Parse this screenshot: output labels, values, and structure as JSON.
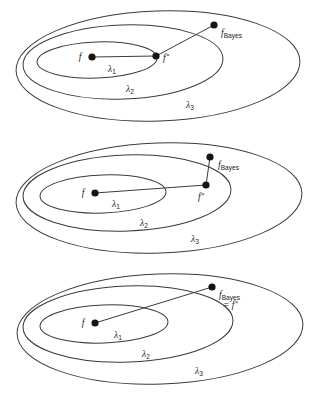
{
  "figure": {
    "background_color": "#ffffff",
    "line_color": "#3b3b3b",
    "point_color": "#141414"
  },
  "panels": [
    {
      "id": "panel-1",
      "caption": "f* on inner boundary, f_Bayes outside all classes",
      "labels": {
        "f": "f",
        "f_star": "f",
        "f_star_sup": "*",
        "f_bayes_main": "f",
        "f_bayes_sub": "Bayes",
        "f_bayes_eq": "",
        "lambda1": "λ",
        "lambda1_sub": "1",
        "lambda2": "λ",
        "lambda2_sub": "2",
        "lambda3": "λ",
        "lambda3_sub": "3"
      },
      "points": {
        "f": {
          "x": 92,
          "y": 57
        },
        "f_star": {
          "x": 156,
          "y": 56
        },
        "f_bayes": {
          "x": 214,
          "y": 25
        }
      },
      "label_positions": {
        "f": {
          "x": 80,
          "y": 57
        },
        "f_star": {
          "x": 163,
          "y": 61
        },
        "f_bayes": {
          "x": 221,
          "y": 33
        },
        "lambda1": {
          "x": 108,
          "y": 70
        },
        "lambda2": {
          "x": 126,
          "y": 90
        },
        "lambda3": {
          "x": 186,
          "y": 106
        }
      },
      "ellipses": [
        {
          "name": "lambda1",
          "cx": 97,
          "cy": 60,
          "rx": 60,
          "ry": 18,
          "rot": -2
        },
        {
          "name": "lambda2",
          "cx": 123,
          "cy": 62,
          "rx": 100,
          "ry": 37,
          "rot": -2
        },
        {
          "name": "lambda3",
          "cx": 158,
          "cy": 66,
          "rx": 142,
          "ry": 55,
          "rot": -2
        }
      ]
    },
    {
      "id": "panel-2",
      "caption": "f* on middle boundary, f_Bayes directly above",
      "labels": {
        "f": "f",
        "f_star": "f",
        "f_star_sup": "*",
        "f_bayes_main": "f",
        "f_bayes_sub": "Bayes",
        "f_bayes_eq": "",
        "lambda1": "λ",
        "lambda1_sub": "1",
        "lambda2": "λ",
        "lambda2_sub": "2",
        "lambda3": "λ",
        "lambda3_sub": "3"
      },
      "points": {
        "f": {
          "x": 95,
          "y": 61
        },
        "f_star": {
          "x": 206,
          "y": 53
        },
        "f_bayes": {
          "x": 210,
          "y": 25
        }
      },
      "label_positions": {
        "f": {
          "x": 83,
          "y": 60
        },
        "f_star": {
          "x": 200,
          "y": 67
        },
        "f_bayes": {
          "x": 218,
          "y": 36
        },
        "lambda1": {
          "x": 112,
          "y": 73
        },
        "lambda2": {
          "x": 140,
          "y": 92
        },
        "lambda3": {
          "x": 191,
          "y": 108
        }
      },
      "ellipses": [
        {
          "name": "lambda1",
          "cx": 103,
          "cy": 62,
          "rx": 63,
          "ry": 19,
          "rot": -2
        },
        {
          "name": "lambda2",
          "cx": 127,
          "cy": 61,
          "rx": 104,
          "ry": 38,
          "rot": -2
        },
        {
          "name": "lambda3",
          "cx": 159,
          "cy": 66,
          "rx": 143,
          "ry": 55,
          "rot": -2
        }
      ]
    },
    {
      "id": "panel-3",
      "caption": "f_Bayes equals f*, both outside all classes",
      "labels": {
        "f": "f",
        "f_star": "f",
        "f_star_sup": "*",
        "f_bayes_main": "f",
        "f_bayes_sub": "Bayes",
        "f_bayes_eq": "= f",
        "lambda1": "λ",
        "lambda1_sub": "1",
        "lambda2": "λ",
        "lambda2_sub": "2",
        "lambda3": "λ",
        "lambda3_sub": "3"
      },
      "points": {
        "f": {
          "x": 95,
          "y": 59
        },
        "f_bayes": {
          "x": 212,
          "y": 23
        }
      },
      "label_positions": {
        "f": {
          "x": 83,
          "y": 58
        },
        "f_bayes": {
          "x": 219,
          "y": 33
        },
        "f_bayes_eq": {
          "x": 223,
          "y": 43
        },
        "lambda1": {
          "x": 114,
          "y": 72
        },
        "lambda2": {
          "x": 142,
          "y": 91
        },
        "lambda3": {
          "x": 195,
          "y": 108
        }
      },
      "ellipses": [
        {
          "name": "lambda1",
          "cx": 104,
          "cy": 60,
          "rx": 64,
          "ry": 19,
          "rot": -2
        },
        {
          "name": "lambda2",
          "cx": 128,
          "cy": 60,
          "rx": 105,
          "ry": 38,
          "rot": -2
        },
        {
          "name": "lambda3",
          "cx": 160,
          "cy": 65,
          "rx": 143,
          "ry": 55,
          "rot": -2
        }
      ]
    }
  ]
}
